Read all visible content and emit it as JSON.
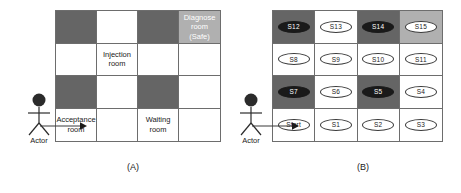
{
  "figure": {
    "panels": [
      {
        "id": "A",
        "caption": "(A)",
        "actor_label": "Actor",
        "grid": {
          "rows": 4,
          "cols": 4,
          "cells": [
            {
              "type": "block",
              "label": ""
            },
            {
              "type": "free",
              "label": ""
            },
            {
              "type": "block",
              "label": ""
            },
            {
              "type": "safe",
              "label": "Diagnose\nroom (Safe)"
            },
            {
              "type": "free",
              "label": ""
            },
            {
              "type": "free",
              "label": "Injection\nroom"
            },
            {
              "type": "free",
              "label": ""
            },
            {
              "type": "free",
              "label": ""
            },
            {
              "type": "block",
              "label": ""
            },
            {
              "type": "free",
              "label": ""
            },
            {
              "type": "block",
              "label": ""
            },
            {
              "type": "free",
              "label": ""
            },
            {
              "type": "free",
              "label": "Acceptance\nroom"
            },
            {
              "type": "free",
              "label": ""
            },
            {
              "type": "free",
              "label": "Waiting\nroom"
            },
            {
              "type": "free",
              "label": ""
            }
          ]
        }
      },
      {
        "id": "B",
        "caption": "(B)",
        "actor_label": "Actor",
        "grid": {
          "rows": 4,
          "cols": 4,
          "cells": [
            {
              "type": "block",
              "state": "S12",
              "state_style": "dark"
            },
            {
              "type": "free",
              "state": "S13",
              "state_style": "light"
            },
            {
              "type": "block",
              "state": "S14",
              "state_style": "dark"
            },
            {
              "type": "safe",
              "state": "S15",
              "state_style": "light"
            },
            {
              "type": "free",
              "state": "S8",
              "state_style": "light"
            },
            {
              "type": "free",
              "state": "S9",
              "state_style": "light"
            },
            {
              "type": "free",
              "state": "S10",
              "state_style": "light"
            },
            {
              "type": "free",
              "state": "S11",
              "state_style": "light"
            },
            {
              "type": "block",
              "state": "S7",
              "state_style": "dark"
            },
            {
              "type": "free",
              "state": "S6",
              "state_style": "light"
            },
            {
              "type": "block",
              "state": "S5",
              "state_style": "dark"
            },
            {
              "type": "free",
              "state": "S4",
              "state_style": "light"
            },
            {
              "type": "free",
              "state": "Start",
              "state_style": "light"
            },
            {
              "type": "free",
              "state": "S1",
              "state_style": "light"
            },
            {
              "type": "free",
              "state": "S2",
              "state_style": "light"
            },
            {
              "type": "free",
              "state": "S3",
              "state_style": "light"
            }
          ]
        }
      }
    ],
    "colors": {
      "blocked_cell": "#656565",
      "free_cell": "#ffffff",
      "safe_cell": "#b0b0b0",
      "grid_line": "#6d6d6d",
      "ink": "#1a1a1a"
    }
  }
}
